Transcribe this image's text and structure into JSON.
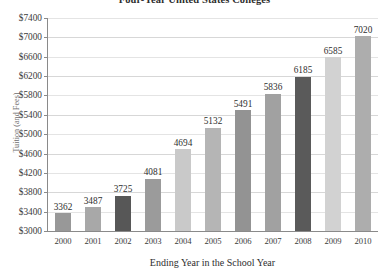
{
  "chart_data": {
    "type": "bar",
    "title": "Four-Year United States Colleges",
    "xlabel": "Ending Year in the School Year",
    "ylabel": "Tuition (and Fees)",
    "categories": [
      "2000",
      "2001",
      "2002",
      "2003",
      "2004",
      "2005",
      "2006",
      "2007",
      "2008",
      "2009",
      "2010"
    ],
    "values": [
      3362,
      3487,
      3725,
      4081,
      4694,
      5132,
      5491,
      5836,
      6185,
      6585,
      7020
    ],
    "value_labels": [
      "3362",
      "3487",
      "3725",
      "4081",
      "4694",
      "5132",
      "5491",
      "5836",
      "6185",
      "6585",
      "7020"
    ],
    "bar_colors": [
      "#989898",
      "#a8a8a8",
      "#575757",
      "#9b9b9b",
      "#c9c9c9",
      "#b5b5b5",
      "#939393",
      "#a1a1a1",
      "#5a5a5a",
      "#d2d2d2",
      "#adadad"
    ],
    "ylim": [
      3000,
      7400
    ],
    "yticks": [
      3000,
      3400,
      3800,
      4200,
      4600,
      5000,
      5400,
      5800,
      6200,
      6600,
      7000,
      7400
    ],
    "ytick_labels": [
      "$3000",
      "$3400",
      "$3800",
      "$4200",
      "$4600",
      "$5000",
      "$5400",
      "$5800",
      "$6200",
      "$6600",
      "$7000",
      "$7400"
    ],
    "grid": true,
    "legend": false,
    "axis_color": "#8a8a8a",
    "grid_color": "#d7d7d7",
    "text_color": "#2e2e2e"
  }
}
